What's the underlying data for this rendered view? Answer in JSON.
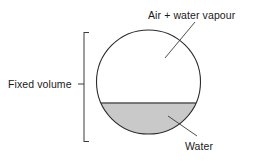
{
  "figure": {
    "type": "labelled-diagram",
    "background_color": "#ffffff",
    "width": 260,
    "height": 163
  },
  "labels": {
    "air": "Air + water vapour",
    "fixed_volume": "Fixed volume",
    "water": "Water"
  },
  "shapes": {
    "vessel": {
      "name": "circle",
      "center_x": 148.5,
      "center_y": 82,
      "radius": 52,
      "stroke_color": "#2b2b2b",
      "stroke_width": 1.1,
      "fill_color": "#ffffff"
    },
    "water_body": {
      "name": "circular-segment",
      "surface_y": 103,
      "fill_color": "#c9c9c9",
      "stroke_color": "#555555"
    },
    "gas_space": {
      "name": "circular-segment",
      "fill_color": "#ffffff"
    },
    "bracket": {
      "name": "left-span-bracket",
      "x": 84,
      "top_y": 32,
      "bottom_y": 142,
      "tick_length": 5,
      "stroke_color": "#3a3a3a"
    }
  },
  "leader_lines": {
    "air": {
      "from_x": 195,
      "from_y": 22,
      "to_x": 165,
      "to_y": 58,
      "stroke_color": "#3a3a3a"
    },
    "water": {
      "from_x": 168,
      "from_y": 116,
      "to_x": 197,
      "to_y": 136,
      "stroke_color": "#3a3a3a"
    },
    "fixed_volume": {
      "from_x": 78,
      "from_y": 84,
      "to_x": 88,
      "to_y": 84,
      "stroke_color": "#3a3a3a"
    }
  }
}
